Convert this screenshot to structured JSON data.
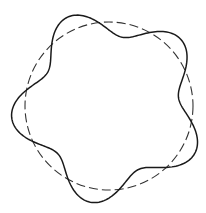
{
  "diagram": {
    "width": 206,
    "height": 213,
    "background": "#ffffff",
    "reference_circle": {
      "cx": 109,
      "cy": 106,
      "r": 84,
      "stroke": "#333333",
      "stroke_width": 1.1,
      "dash": "9 4",
      "style": "dashed"
    },
    "wavy_curve": {
      "cx": 109,
      "cy": 106,
      "base_radius": 84,
      "amplitude": 14,
      "lobes": 5,
      "phase_deg": 305,
      "stroke": "#1a1a1a",
      "stroke_width": 1.5,
      "style": "solid"
    }
  }
}
